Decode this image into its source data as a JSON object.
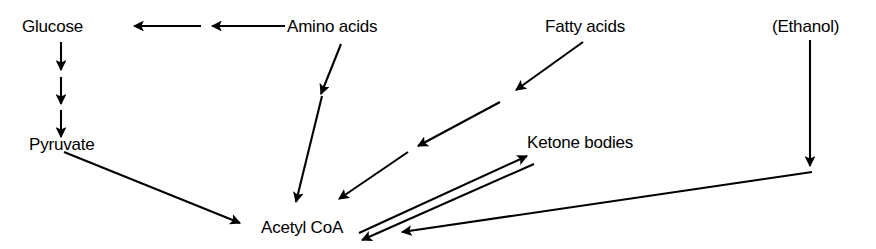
{
  "diagram": {
    "type": "flow-diagram",
    "background_color": "#ffffff",
    "stroke_color": "#000000",
    "nodes": [
      {
        "id": "glucose",
        "label": "Glucose",
        "x": 22,
        "y": 18
      },
      {
        "id": "amino_acids",
        "label": "Amino acids",
        "x": 287,
        "y": 18
      },
      {
        "id": "fatty_acids",
        "label": "Fatty acids",
        "x": 545,
        "y": 18
      },
      {
        "id": "ethanol",
        "label": "(Ethanol)",
        "x": 772,
        "y": 18
      },
      {
        "id": "pyruvate",
        "label": "Pyruvate",
        "x": 29,
        "y": 136
      },
      {
        "id": "ketone",
        "label": "Ketone bodies",
        "x": 527,
        "y": 134
      },
      {
        "id": "acetyl_coa",
        "label": "Acetyl CoA",
        "x": 261,
        "y": 219
      }
    ],
    "edges": [
      {
        "id": "amino-to-glucose-1",
        "from": "amino_acids",
        "to": "glucose",
        "style": "arrow",
        "direction": "left"
      },
      {
        "id": "amino-to-glucose-2",
        "from": "amino_acids",
        "to": "glucose",
        "style": "arrow",
        "direction": "left"
      },
      {
        "id": "glucose-to-pyruvate-1",
        "from": "glucose",
        "to": "pyruvate",
        "style": "arrow",
        "direction": "down"
      },
      {
        "id": "glucose-to-pyruvate-2",
        "from": "glucose",
        "to": "pyruvate",
        "style": "arrow",
        "direction": "down"
      },
      {
        "id": "glucose-to-pyruvate-3",
        "from": "glucose",
        "to": "pyruvate",
        "style": "arrow",
        "direction": "down"
      },
      {
        "id": "amino-to-acetyl-1",
        "from": "amino_acids",
        "to": "acetyl_coa",
        "style": "arrow",
        "direction": "down-left"
      },
      {
        "id": "amino-to-acetyl-2",
        "from": "amino_acids",
        "to": "acetyl_coa",
        "style": "arrow",
        "direction": "down-left"
      },
      {
        "id": "fatty-to-acetyl-1",
        "from": "fatty_acids",
        "to": "acetyl_coa",
        "style": "arrow",
        "direction": "down-left"
      },
      {
        "id": "fatty-to-acetyl-2",
        "from": "fatty_acids",
        "to": "acetyl_coa",
        "style": "arrow",
        "direction": "down-left"
      },
      {
        "id": "pyruvate-to-acetyl",
        "from": "pyruvate",
        "to": "acetyl_coa",
        "style": "arrow",
        "direction": "down-right"
      },
      {
        "id": "acetyl-to-ketone",
        "from": "acetyl_coa",
        "to": "ketone",
        "style": "arrow",
        "direction": "up-right"
      },
      {
        "id": "ketone-to-acetyl",
        "from": "ketone",
        "to": "acetyl_coa",
        "style": "arrow",
        "direction": "down-left"
      },
      {
        "id": "ethanol-down",
        "from": "ethanol",
        "to": "ethanol",
        "style": "arrow",
        "direction": "down"
      },
      {
        "id": "ethanol-to-acetyl",
        "from": "ethanol",
        "to": "acetyl_coa",
        "style": "arrow",
        "direction": "left"
      }
    ]
  }
}
